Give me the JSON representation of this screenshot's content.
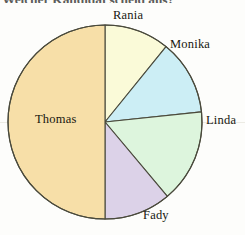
{
  "title": "Welcher Kandidat scheid aus?",
  "chart_data": {
    "type": "pie",
    "title": "Welcher Kandidat scheid aus?",
    "xlabel": "",
    "ylabel": "",
    "legend_position": "outside-labels",
    "grid": false,
    "start_angle_deg": 0,
    "direction": "clockwise",
    "categories": [
      "Rania",
      "Monika",
      "Linda",
      "Fady",
      "Thomas"
    ],
    "values": [
      10.8,
      12.5,
      15.6,
      11.1,
      50.0
    ],
    "units": "percent",
    "slices": [
      {
        "label": "Rania",
        "value": 10.8,
        "start_deg": 0,
        "end_deg": 39,
        "color": "#fafad8"
      },
      {
        "label": "Monika",
        "value": 12.5,
        "start_deg": 39,
        "end_deg": 84,
        "color": "#cceef5"
      },
      {
        "label": "Linda",
        "value": 15.6,
        "start_deg": 84,
        "end_deg": 140,
        "color": "#ddf5dd"
      },
      {
        "label": "Fady",
        "value": 11.1,
        "start_deg": 140,
        "end_deg": 180,
        "color": "#dcd2e8"
      },
      {
        "label": "Thomas",
        "value": 50.0,
        "start_deg": 180,
        "end_deg": 360,
        "color": "#f7dfa8"
      }
    ],
    "geometry": {
      "cx": 105,
      "cy": 122,
      "r": 97
    },
    "stroke_color": "#4a4a3c",
    "labels": {
      "rania": "Rania",
      "monika": "Monika",
      "linda": "Linda",
      "fady": "Fady",
      "thomas": "Thomas"
    }
  }
}
